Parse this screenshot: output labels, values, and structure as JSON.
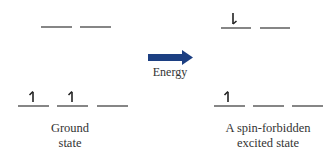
{
  "diagram": {
    "arrow_label": "Energy",
    "arrow_color": "#1c3f82",
    "line_color": "#444444",
    "ground_state": {
      "label_line1": "Ground",
      "label_line2": "state",
      "upper_orbitals": [
        {
          "electron": "none"
        },
        {
          "electron": "none"
        }
      ],
      "lower_orbitals": [
        {
          "electron": "up"
        },
        {
          "electron": "up"
        },
        {
          "electron": "none"
        }
      ]
    },
    "excited_state": {
      "label_line1": "A spin-forbidden",
      "label_line2": "excited state",
      "upper_orbitals": [
        {
          "electron": "down"
        },
        {
          "electron": "none"
        }
      ],
      "lower_orbitals": [
        {
          "electron": "up"
        },
        {
          "electron": "none"
        },
        {
          "electron": "none"
        }
      ]
    }
  }
}
